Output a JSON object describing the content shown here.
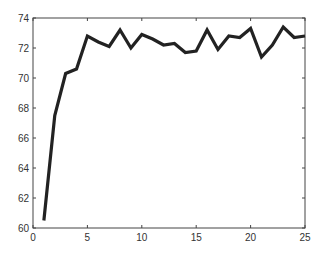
{
  "chart_data": {
    "type": "line",
    "title": "",
    "xlabel": "",
    "ylabel": "",
    "xlim": [
      0,
      25
    ],
    "ylim": [
      60,
      74
    ],
    "grid": false,
    "legend": null,
    "xticks": [
      0,
      5,
      10,
      15,
      20,
      25
    ],
    "yticks": [
      60,
      62,
      64,
      66,
      68,
      70,
      72,
      74
    ],
    "x": [
      1,
      2,
      3,
      4,
      5,
      6,
      7,
      8,
      9,
      10,
      11,
      12,
      13,
      14,
      15,
      16,
      17,
      18,
      19,
      20,
      21,
      22,
      23,
      24,
      25
    ],
    "series": [
      {
        "name": "series-1",
        "color": "#222222",
        "values": [
          60.5,
          67.5,
          70.3,
          70.6,
          72.8,
          72.4,
          72.1,
          73.2,
          72.0,
          72.9,
          72.6,
          72.2,
          72.3,
          71.7,
          71.8,
          73.2,
          71.9,
          72.8,
          72.7,
          73.3,
          71.4,
          72.2,
          73.4,
          72.7,
          72.8
        ]
      }
    ]
  }
}
